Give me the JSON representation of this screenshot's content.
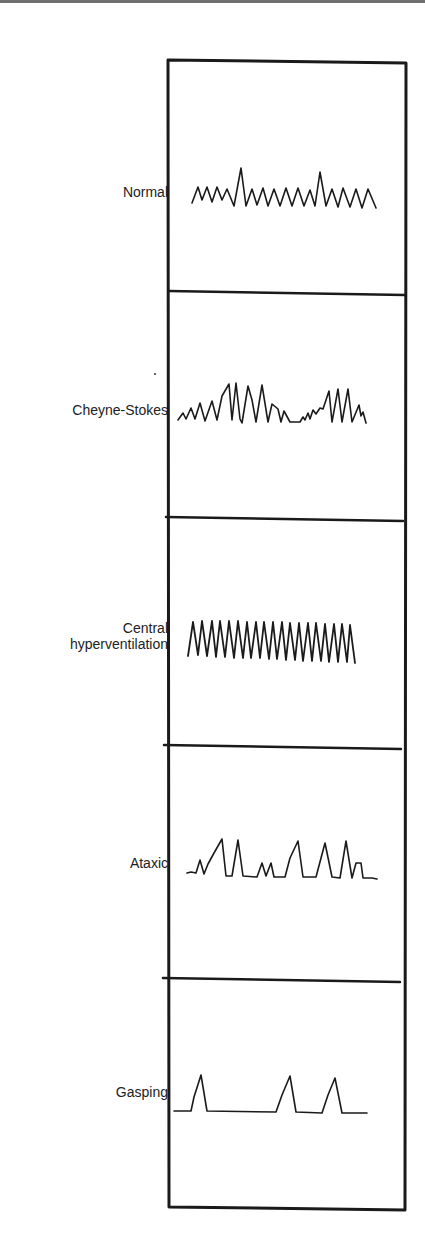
{
  "figure": {
    "panels": [
      {
        "label": "Normal",
        "pattern": "normal"
      },
      {
        "label": "Cheyne-Stokes",
        "pattern": "cheyne-stokes"
      },
      {
        "label_line1": "Central",
        "label_line2": "hyperventilation",
        "pattern": "central-hyperventilation"
      },
      {
        "label": "Ataxic",
        "pattern": "ataxic"
      },
      {
        "label": "Gasping",
        "pattern": "gasping"
      }
    ],
    "colors": {
      "ink": "#1a1a1a",
      "label": "#222222",
      "background": "#ffffff"
    }
  }
}
